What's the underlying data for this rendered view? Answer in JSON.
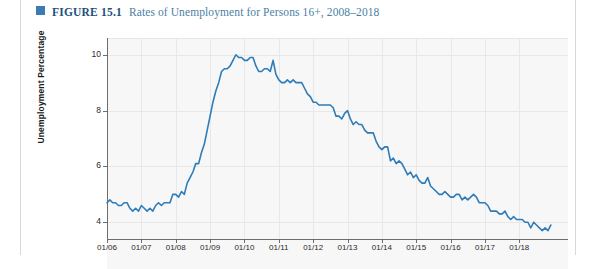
{
  "figure": {
    "marker_color": "#3b7ab5",
    "label": "FIGURE 15.1",
    "title": "Rates of Unemployment for Persons 16+, 2008–2018"
  },
  "chart_data": {
    "type": "line",
    "title": "Rates of Unemployment for Persons 16+, 2008–2018",
    "xlabel": "",
    "ylabel": "Unemployment Percentage",
    "line_color": "#2e7cb8",
    "grid": true,
    "legend": false,
    "xlim": [
      "01/06",
      "01/19"
    ],
    "ylim": [
      3.4,
      10.6
    ],
    "yticks": [
      4,
      6,
      8,
      10
    ],
    "ytick_labels": [
      "4",
      "6",
      "8",
      "10"
    ],
    "xticks": [
      "01/06",
      "01/07",
      "01/08",
      "01/09",
      "01/10",
      "01/11",
      "01/12",
      "01/13",
      "01/14",
      "01/15",
      "01/16",
      "01/17",
      "01/18"
    ],
    "series": [
      {
        "name": "Unemployment Percentage",
        "x": [
          "01/06",
          "02/06",
          "03/06",
          "04/06",
          "05/06",
          "06/06",
          "07/06",
          "08/06",
          "09/06",
          "10/06",
          "11/06",
          "12/06",
          "01/07",
          "02/07",
          "03/07",
          "04/07",
          "05/07",
          "06/07",
          "07/07",
          "08/07",
          "09/07",
          "10/07",
          "11/07",
          "12/07",
          "01/08",
          "02/08",
          "03/08",
          "04/08",
          "05/08",
          "06/08",
          "07/08",
          "08/08",
          "09/08",
          "10/08",
          "11/08",
          "12/08",
          "01/09",
          "02/09",
          "03/09",
          "04/09",
          "05/09",
          "06/09",
          "07/09",
          "08/09",
          "09/09",
          "10/09",
          "11/09",
          "12/09",
          "01/10",
          "02/10",
          "03/10",
          "04/10",
          "05/10",
          "06/10",
          "07/10",
          "08/10",
          "09/10",
          "10/10",
          "11/10",
          "12/10",
          "01/11",
          "02/11",
          "03/11",
          "04/11",
          "05/11",
          "06/11",
          "07/11",
          "08/11",
          "09/11",
          "10/11",
          "11/11",
          "12/11",
          "01/12",
          "02/12",
          "03/12",
          "04/12",
          "05/12",
          "06/12",
          "07/12",
          "08/12",
          "09/12",
          "10/12",
          "11/12",
          "12/12",
          "01/13",
          "02/13",
          "03/13",
          "04/13",
          "05/13",
          "06/13",
          "07/13",
          "08/13",
          "09/13",
          "10/13",
          "11/13",
          "12/13",
          "01/14",
          "02/14",
          "03/14",
          "04/14",
          "05/14",
          "06/14",
          "07/14",
          "08/14",
          "09/14",
          "10/14",
          "11/14",
          "12/14",
          "01/15",
          "02/15",
          "03/15",
          "04/15",
          "05/15",
          "06/15",
          "07/15",
          "08/15",
          "09/15",
          "10/15",
          "11/15",
          "12/15",
          "01/16",
          "02/16",
          "03/16",
          "04/16",
          "05/16",
          "06/16",
          "07/16",
          "08/16",
          "09/16",
          "10/16",
          "11/16",
          "12/16",
          "01/17",
          "02/17",
          "03/17",
          "04/17",
          "05/17",
          "06/17",
          "07/17",
          "08/17",
          "09/17",
          "10/17",
          "11/17",
          "12/17",
          "01/18",
          "02/18",
          "03/18",
          "04/18",
          "05/18",
          "06/18",
          "07/18",
          "08/18",
          "09/18",
          "10/18",
          "11/18",
          "12/18"
        ],
        "values": [
          4.7,
          4.8,
          4.7,
          4.7,
          4.6,
          4.6,
          4.7,
          4.7,
          4.5,
          4.4,
          4.5,
          4.4,
          4.6,
          4.5,
          4.4,
          4.5,
          4.4,
          4.6,
          4.7,
          4.6,
          4.7,
          4.7,
          4.7,
          5.0,
          5.0,
          4.9,
          5.1,
          5.0,
          5.4,
          5.6,
          5.8,
          6.1,
          6.1,
          6.5,
          6.8,
          7.3,
          7.8,
          8.3,
          8.7,
          9.0,
          9.4,
          9.5,
          9.5,
          9.6,
          9.8,
          10.0,
          9.9,
          9.9,
          9.8,
          9.8,
          9.9,
          9.9,
          9.6,
          9.4,
          9.4,
          9.5,
          9.5,
          9.4,
          9.8,
          9.3,
          9.1,
          9.0,
          9.0,
          9.1,
          9.0,
          9.1,
          9.0,
          9.0,
          9.0,
          8.8,
          8.6,
          8.5,
          8.3,
          8.3,
          8.2,
          8.2,
          8.2,
          8.2,
          8.2,
          8.1,
          7.8,
          7.8,
          7.7,
          7.9,
          8.0,
          7.7,
          7.5,
          7.6,
          7.5,
          7.5,
          7.3,
          7.2,
          7.2,
          7.2,
          6.9,
          6.7,
          6.6,
          6.7,
          6.7,
          6.2,
          6.3,
          6.1,
          6.2,
          6.1,
          5.9,
          5.7,
          5.8,
          5.6,
          5.7,
          5.5,
          5.4,
          5.4,
          5.6,
          5.3,
          5.2,
          5.1,
          5.0,
          5.0,
          5.1,
          5.0,
          4.9,
          4.9,
          5.0,
          5.0,
          4.8,
          4.9,
          4.8,
          4.9,
          5.0,
          4.9,
          4.7,
          4.7,
          4.7,
          4.6,
          4.4,
          4.4,
          4.4,
          4.3,
          4.3,
          4.4,
          4.2,
          4.1,
          4.2,
          4.1,
          4.1,
          4.1,
          4.0,
          4.0,
          3.8,
          4.0,
          3.9,
          3.8,
          3.7,
          3.8,
          3.7,
          3.9
        ]
      }
    ]
  }
}
